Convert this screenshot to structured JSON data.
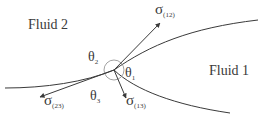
{
  "diagram": {
    "regions": {
      "fluid2": "Fluid 2",
      "fluid1": "Fluid 1"
    },
    "tensions": {
      "s12": {
        "symbol": "σ",
        "sub": "(12)"
      },
      "s13": {
        "symbol": "σ",
        "sub": "(13)"
      },
      "s23": {
        "symbol": "σ",
        "sub": "(23)"
      }
    },
    "angles": {
      "t1": {
        "symbol": "θ",
        "sub": "1"
      },
      "t2": {
        "symbol": "θ",
        "sub": "2"
      },
      "t3": {
        "symbol": "θ",
        "sub": "3"
      }
    },
    "colors": {
      "line": "#3a3a3a",
      "arc": "#8a8a8a",
      "background": "#ffffff"
    }
  }
}
